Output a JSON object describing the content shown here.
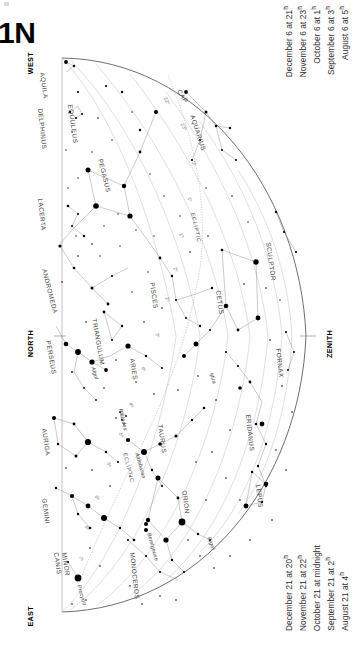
{
  "title": "1N",
  "legend_top": {
    "lines": [
      {
        "date": "August 6 at",
        "hour": "5",
        "sup": "h"
      },
      {
        "date": "September 6 at",
        "hour": "3",
        "sup": "h"
      },
      {
        "date": "October 6 at",
        "hour": "1",
        "sup": "h"
      },
      {
        "date": "November 6 at",
        "hour": "23",
        "sup": "h"
      },
      {
        "date": "December 6 at",
        "hour": "21",
        "sup": "h"
      }
    ]
  },
  "legend_bottom": {
    "lines": [
      {
        "date": "August 21 at",
        "hour": "4",
        "sup": "h"
      },
      {
        "date": "September 21 at",
        "hour": "2",
        "sup": "h"
      },
      {
        "date": "October 21 at",
        "hour": "midnight",
        "sup": ""
      },
      {
        "date": "November 21 at",
        "hour": "22",
        "sup": "h"
      },
      {
        "date": "December 21 at",
        "hour": "20",
        "sup": "h"
      }
    ]
  },
  "cardinals": {
    "west": "WEST",
    "north": "NORTH",
    "east": "EAST",
    "zenith": "ZENITH"
  },
  "ecliptic_label": "ECLIPTIC",
  "ra_labels": [
    {
      "text": "22ʰ",
      "x": 168,
      "y": 96,
      "rot": 62
    },
    {
      "text": "23ʰ",
      "x": 185,
      "y": 122,
      "rot": 62
    },
    {
      "text": "0ʰ",
      "x": 196,
      "y": 160,
      "rot": 64
    },
    {
      "text": "1ʰ",
      "x": 192,
      "y": 196,
      "rot": 66
    },
    {
      "text": "1ʰ",
      "x": 184,
      "y": 232,
      "rot": 68
    },
    {
      "text": "2ʰ",
      "x": 178,
      "y": 266,
      "rot": 70
    },
    {
      "text": "2ʰ",
      "x": 170,
      "y": 296,
      "rot": 72
    },
    {
      "text": "3ʰ",
      "x": 160,
      "y": 332,
      "rot": 74
    },
    {
      "text": "4ʰ",
      "x": 146,
      "y": 366,
      "rot": 76
    },
    {
      "text": "4ʰ",
      "x": 134,
      "y": 402,
      "rot": 78
    },
    {
      "text": "5ʰ",
      "x": 124,
      "y": 432,
      "rot": 78
    },
    {
      "text": "5ʰ",
      "x": 112,
      "y": 462,
      "rot": 80
    },
    {
      "text": "6ʰ",
      "x": 100,
      "y": 495,
      "rot": 80
    },
    {
      "text": "6ʰ",
      "x": 90,
      "y": 525,
      "rot": 82
    },
    {
      "text": "7ʰ",
      "x": 84,
      "y": 556,
      "rot": 82
    }
  ],
  "constellations": [
    {
      "name": "AQUILA",
      "x": 46,
      "y": 72,
      "rot": 82
    },
    {
      "name": "DELPHINUS",
      "x": 44,
      "y": 108,
      "rot": 84
    },
    {
      "name": "EQUULEUS",
      "x": 74,
      "y": 104,
      "rot": 82
    },
    {
      "name": "PEGASUS",
      "x": 104,
      "y": 158,
      "rot": 76
    },
    {
      "name": "LACERTA",
      "x": 44,
      "y": 198,
      "rot": 84
    },
    {
      "name": "CAP",
      "x": 182,
      "y": 88,
      "rot": 58
    },
    {
      "name": "AQUARIUS",
      "x": 196,
      "y": 114,
      "rot": 72
    },
    {
      "name": "ANDROMEDA",
      "x": 48,
      "y": 268,
      "rot": 76
    },
    {
      "name": "PISCES",
      "x": 156,
      "y": 282,
      "rot": 82
    },
    {
      "name": "CETUS",
      "x": 222,
      "y": 290,
      "rot": 82
    },
    {
      "name": "SCULPTOR",
      "x": 272,
      "y": 242,
      "rot": 82
    },
    {
      "name": "PERSEUS",
      "x": 52,
      "y": 340,
      "rot": 80
    },
    {
      "name": "TRIANGULUM",
      "x": 98,
      "y": 318,
      "rot": 80
    },
    {
      "name": "ARIES",
      "x": 136,
      "y": 358,
      "rot": 82
    },
    {
      "name": "FORNAX",
      "x": 282,
      "y": 348,
      "rot": 84
    },
    {
      "name": "AURIGA",
      "x": 48,
      "y": 428,
      "rot": 82
    },
    {
      "name": "TAURUS",
      "x": 164,
      "y": 424,
      "rot": 82
    },
    {
      "name": "ERIDANUS",
      "x": 252,
      "y": 414,
      "rot": 84
    },
    {
      "name": "GEMINI",
      "x": 48,
      "y": 498,
      "rot": 82
    },
    {
      "name": "ORION",
      "x": 188,
      "y": 490,
      "rot": 82
    },
    {
      "name": "LEPUS",
      "x": 262,
      "y": 484,
      "rot": 84
    },
    {
      "name": "MONOCEROS",
      "x": 136,
      "y": 552,
      "rot": 84
    },
    {
      "name": "CANIS",
      "x": 60,
      "y": 552,
      "rot": 82
    },
    {
      "name": "MINOR",
      "x": 68,
      "y": 552,
      "rot": 82
    }
  ],
  "stars_named": [
    {
      "name": "Algol",
      "x": 96,
      "y": 366,
      "rot": 72
    },
    {
      "name": "Mira",
      "x": 214,
      "y": 372,
      "rot": 70
    },
    {
      "name": "Pleiades",
      "x": 124,
      "y": 408,
      "rot": 78
    },
    {
      "name": "Aldebaran",
      "x": 140,
      "y": 452,
      "rot": 74
    },
    {
      "name": "Rigel",
      "x": 212,
      "y": 536,
      "rot": 70
    },
    {
      "name": "Betelgeuse",
      "x": 152,
      "y": 532,
      "rot": 74
    },
    {
      "name": "Procyon",
      "x": 82,
      "y": 584,
      "rot": 74
    }
  ],
  "colors": {
    "star": "#000000",
    "constellation_line": "#8a8a8a",
    "horizon": "#4a4a4a",
    "ecliptic": "#9a9a9a",
    "text": "#3c3c3c",
    "background": "#ffffff"
  },
  "diagram_meta": {
    "type": "star-chart",
    "projection": "half-dome horizon map",
    "orientation_left_edge": "west-north-east meridian",
    "zenith_side": "right"
  }
}
